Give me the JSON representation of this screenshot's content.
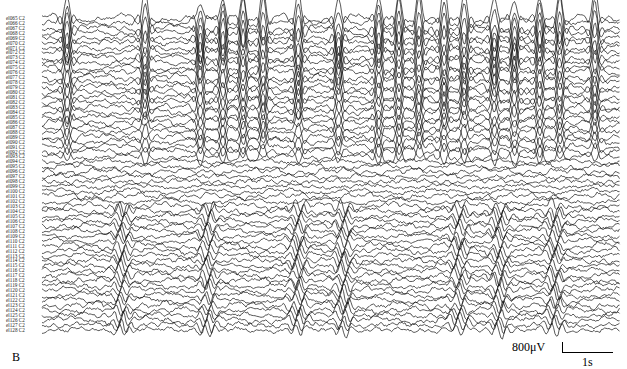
{
  "chart_data": {
    "type": "line",
    "title": "",
    "panel_label": "B",
    "channels": {
      "prefix": "el",
      "suffix": "C2",
      "first": 65,
      "last": 128,
      "count": 64
    },
    "scale_bar": {
      "amplitude_label": "800μV",
      "time_label": "1s",
      "amplitude_uV": 800,
      "time_s": 1
    },
    "duration_s": 11.5,
    "events": {
      "upper_bursts_s": [
        0.5,
        2.05,
        3.15,
        3.6,
        4.0,
        4.4,
        5.1,
        5.9,
        6.7,
        7.1,
        7.5,
        8.0,
        8.4,
        9.0,
        9.4,
        9.9,
        10.3,
        11.0
      ],
      "upper_channel_fraction": 0.45,
      "lower_activity_s": [
        1.6,
        3.3,
        5.1,
        6.0,
        8.3,
        9.1,
        10.2
      ],
      "lower_channel_range_fraction": [
        0.6,
        1.0
      ]
    }
  }
}
